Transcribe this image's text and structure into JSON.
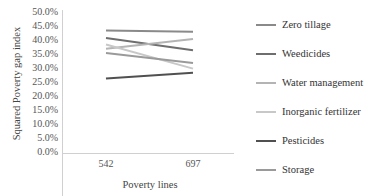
{
  "chart_data": {
    "type": "line",
    "title": "",
    "xlabel": "Poverty lines",
    "ylabel": "Squared Poverty  gap index",
    "categories": [
      "542",
      "697"
    ],
    "ylim": [
      0,
      50
    ],
    "yticks": [
      "0.0%",
      "5.0%",
      "10.0%",
      "15.0%",
      "20.0%",
      "25.0%",
      "30.0%",
      "35.0%",
      "40.0%",
      "45.0%",
      "50.0%"
    ],
    "grid": false,
    "legend_position": "right",
    "series": [
      {
        "name": "Zero tillage",
        "values": [
          43.5,
          43.0
        ],
        "color": "#8a8a8a"
      },
      {
        "name": "Weedicides",
        "values": [
          40.8,
          36.5
        ],
        "color": "#6e6e6e"
      },
      {
        "name": "Water management",
        "values": [
          37.0,
          40.5
        ],
        "color": "#b4b4b4"
      },
      {
        "name": "Inorganic fertilizer",
        "values": [
          38.5,
          30.0
        ],
        "color": "#c8c8c8"
      },
      {
        "name": "Pesticides",
        "values": [
          26.5,
          28.5
        ],
        "color": "#505050"
      },
      {
        "name": "Storage",
        "values": [
          35.5,
          32.0
        ],
        "color": "#9a9a9a"
      }
    ]
  }
}
